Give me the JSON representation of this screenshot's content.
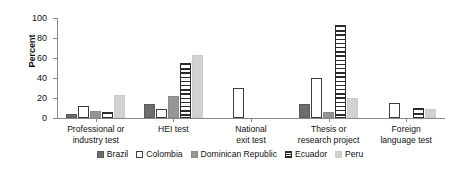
{
  "chart_data": {
    "type": "bar",
    "title": "",
    "xlabel": "",
    "ylabel": "Percent",
    "ylim": [
      0,
      100
    ],
    "yticks": [
      0,
      20,
      40,
      60,
      80,
      100
    ],
    "grid": false,
    "legend_position": "bottom",
    "categories": [
      "Professional or industry test",
      "HEI test",
      "National exit test",
      "Thesis or research project",
      "Foreign language test"
    ],
    "category_lines": [
      [
        "Professional or",
        "industry test"
      ],
      [
        "HEI test",
        ""
      ],
      [
        "National",
        "exit test"
      ],
      [
        "Thesis or",
        "research project"
      ],
      [
        "Foreign",
        "language test"
      ]
    ],
    "series": [
      {
        "name": "Brazil",
        "key": "brazil",
        "color": "#6d6d6d",
        "values": [
          4,
          14,
          0,
          14,
          0
        ]
      },
      {
        "name": "Colombia",
        "key": "colombia",
        "color": "#ffffff",
        "values": [
          12,
          9,
          30,
          40,
          15
        ]
      },
      {
        "name": "Dominican Republic",
        "key": "dominican",
        "color": "#969696",
        "values": [
          7,
          22,
          0,
          6,
          0
        ]
      },
      {
        "name": "Ecuador",
        "key": "ecuador",
        "color": "#2b2b2b",
        "values": [
          6,
          55,
          0,
          93,
          10
        ]
      },
      {
        "name": "Peru",
        "key": "peru",
        "color": "#d2d2d2",
        "values": [
          23,
          63,
          0,
          20,
          9
        ]
      }
    ]
  }
}
